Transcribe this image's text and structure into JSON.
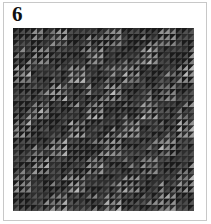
{
  "figure": {
    "label": "6",
    "pattern": {
      "description": "grid of half-square triangle tiles in grayscale",
      "cols": 30,
      "rows": 30,
      "colors": {
        "dark": "#1a1a1a",
        "mid": "#5a5a5a",
        "light": "#9a9a9a",
        "highlight": "#bdbdbd"
      }
    }
  }
}
